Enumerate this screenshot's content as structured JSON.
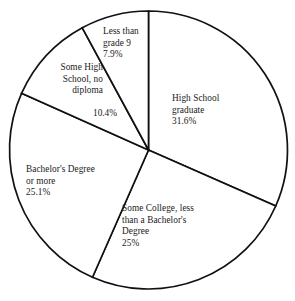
{
  "chart_data": {
    "type": "pie",
    "title": "",
    "subtitle": "",
    "xlabel": "",
    "ylabel": "",
    "legend_position": "none",
    "grid": false,
    "start_angle_deg": 0,
    "direction": "clockwise",
    "center": {
      "x": 148.5,
      "y": 150
    },
    "radius": 139,
    "categories": [
      "High School graduate",
      "Some College, less than a Bachelor's Degree",
      "Bachelor's Degree or more",
      "Some High School, no diploma",
      "Less than grade 9"
    ],
    "values": [
      31.6,
      25,
      25.1,
      10.4,
      7.9
    ],
    "value_labels": [
      "31.6%",
      "25%",
      "25.1%",
      "10.4%",
      "7.9%"
    ],
    "slices": [
      {
        "name": "High School graduate",
        "value": 31.6,
        "value_label": "31.6%",
        "start_deg": 0,
        "end_deg": 113.76,
        "fill": "#ffffff",
        "stroke": "#111111"
      },
      {
        "name": "Some College, less than a Bachelor's Degree",
        "value": 25,
        "value_label": "25%",
        "start_deg": 113.76,
        "end_deg": 203.76,
        "fill": "#ffffff",
        "stroke": "#111111"
      },
      {
        "name": "Bachelor's Degree or more",
        "value": 25.1,
        "value_label": "25.1%",
        "start_deg": 203.76,
        "end_deg": 294.12,
        "fill": "#ffffff",
        "stroke": "#111111"
      },
      {
        "name": "Some High School, no diploma",
        "value": 10.4,
        "value_label": "10.4%",
        "start_deg": 294.12,
        "end_deg": 331.56,
        "fill": "#ffffff",
        "stroke": "#111111"
      },
      {
        "name": "Less than grade 9",
        "value": 7.9,
        "value_label": "7.9%",
        "start_deg": 331.56,
        "end_deg": 360,
        "fill": "#ffffff",
        "stroke": "#111111"
      }
    ]
  },
  "labels": {
    "less_than_grade_9": "Less than\ngrade 9\n7.9%",
    "some_high_school": "Some High\nSchool, no\ndiploma",
    "some_high_school_pct": "10.4%",
    "high_school_graduate": "High School\ngraduate\n31.6%",
    "bachelors_degree": "Bachelor's Degree\nor more\n25.1%",
    "some_college": "Some College, less\nthan a Bachelor's\nDegree\n25%"
  },
  "colors": {
    "background": "#ffffff",
    "outline": "#111111",
    "text": "#1a1a1a"
  }
}
